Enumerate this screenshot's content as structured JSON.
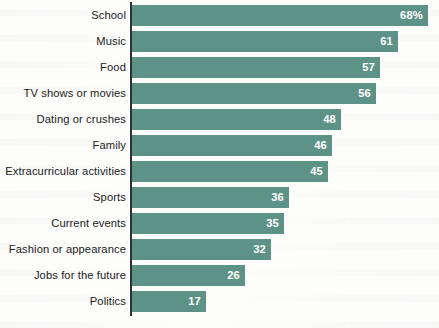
{
  "chart_data": {
    "type": "bar",
    "orientation": "horizontal",
    "title": "",
    "subtitle": "",
    "xlabel": "",
    "ylabel": "",
    "grid": false,
    "legend": false,
    "axis_line": "left",
    "xlim": [
      0,
      70
    ],
    "bar_color": "#5d9286",
    "label_color": "#1c2220",
    "value_label_color": "#ffffff",
    "categories": [
      "School",
      "Music",
      "Food",
      "TV shows or movies",
      "Dating or crushes",
      "Family",
      "Extracurricular activities",
      "Sports",
      "Current events",
      "Fashion or appearance",
      "Jobs for the future",
      "Politics"
    ],
    "values": [
      68,
      61,
      57,
      56,
      48,
      46,
      45,
      36,
      35,
      32,
      26,
      17
    ],
    "value_labels": [
      "68%",
      "61",
      "57",
      "56",
      "48",
      "46",
      "45",
      "36",
      "35",
      "32",
      "26",
      "17"
    ]
  }
}
